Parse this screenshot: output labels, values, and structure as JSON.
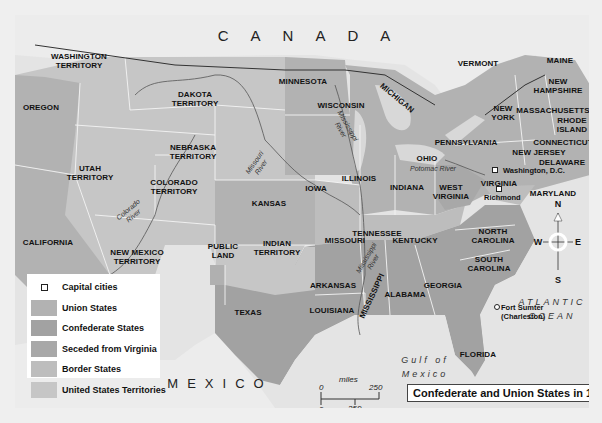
{
  "map": {
    "title": "Confederate and Union States in 1861",
    "country_labels": {
      "canada": "CANADA",
      "mexico": "MEXICO"
    },
    "water_labels": {
      "gulf_line1": "Gulf of",
      "gulf_line2": "Mexico",
      "atlantic_line1": "ATLANTIC",
      "atlantic_line2": "OCEAN"
    },
    "colors": {
      "union": "#b2b2b2",
      "confederate": "#a2a2a2",
      "seceded_virginia": "#a8a8a8",
      "border": "#bdbdbd",
      "territories": "#c6c6c6",
      "water": "#e4e4e4",
      "foreign": "#ececec"
    },
    "regions": {
      "washington_territory": "WASHINGTON\nTERRITORY",
      "oregon": "OREGON",
      "dakota_territory": "DAKOTA\nTERRITORY",
      "minnesota": "MINNESOTA",
      "wisconsin": "WISCONSIN",
      "michigan": "MICHIGAN",
      "vermont": "VERMONT",
      "maine": "MAINE",
      "new_hampshire": "NEW\nHAMPSHIRE",
      "massachusetts": "MASSACHUSETTS",
      "rhode_island": "RHODE\nISLAND",
      "connecticut": "CONNECTICUT",
      "new_york": "NEW\nYORK",
      "new_jersey": "NEW JERSEY",
      "delaware": "DELAWARE",
      "pennsylvania": "PENNSYLVANIA",
      "nebraska_territory": "NEBRASKA\nTERRITORY",
      "iowa": "IOWA",
      "illinois": "ILLINOIS",
      "indiana": "INDIANA",
      "ohio": "OHIO",
      "utah_territory": "UTAH\nTERRITORY",
      "colorado_territory": "COLORADO\nTERRITORY",
      "kansas": "KANSAS",
      "missouri": "MISSOURI",
      "kentucky": "KENTUCKY",
      "west_virginia": "WEST\nVIRGINIA",
      "virginia": "VIRGINIA",
      "maryland": "MARYLAND",
      "california": "CALIFORNIA",
      "new_mexico_territory": "NEW MEXICO\nTERRITORY",
      "public_land": "PUBLIC\nLAND",
      "indian_territory": "INDIAN\nTERRITORY",
      "arkansas": "ARKANSAS",
      "tennessee": "TENNESSEE",
      "north_carolina": "NORTH\nCAROLINA",
      "south_carolina": "SOUTH\nCAROLINA",
      "mississippi": "MISSISSIPPI",
      "alabama": "ALABAMA",
      "georgia": "GEORGIA",
      "louisiana": "LOUISIANA",
      "texas": "TEXAS",
      "florida": "FLORIDA"
    },
    "rivers": {
      "missouri": "Missouri\nRiver",
      "mississippi_north": "Mississippi\nRiver",
      "mississippi_south": "Mississippi\nRiver",
      "colorado": "Colorado\nRiver",
      "potomac": "Potomac River"
    },
    "cities": {
      "washington": "Washington, D.C.",
      "richmond": "Richmond",
      "fort_sumter_line1": "Fort Sumter",
      "fort_sumter_line2": "(Charleston)"
    },
    "compass": {
      "n": "N",
      "s": "S",
      "e": "E",
      "w": "W"
    },
    "scale": {
      "miles_label": "miles",
      "km_label": "km",
      "zero": "0",
      "miles_max": "250",
      "km_max": "250"
    }
  },
  "legend": {
    "items": [
      {
        "label": "Capital cities",
        "type": "capital"
      },
      {
        "label": "Union States",
        "type": "union"
      },
      {
        "label": "Confederate States",
        "type": "confederate"
      },
      {
        "label": "Seceded from Virginia",
        "type": "seceded_virginia"
      },
      {
        "label": "Border States",
        "type": "border"
      },
      {
        "label": "United States Territories",
        "type": "territories"
      }
    ]
  }
}
